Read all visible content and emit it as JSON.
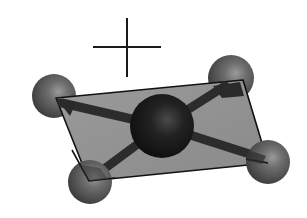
{
  "diagram": {
    "title": "Square planar molecular geometry",
    "colors": {
      "background": "#ffffff",
      "plane_fill": "#8f8f8f",
      "plane_edge": "#111111",
      "central_atom": "#1e1e1e",
      "ligand_atom": "#5a5a5a",
      "bond": "#2c2c2c",
      "axis_cross": "#1a1a1a"
    },
    "cross_axis": {
      "horizontal": {
        "x1": 93,
        "y1": 47,
        "x2": 161,
        "y2": 47
      },
      "vertical": {
        "x1": 127,
        "y1": 18,
        "x2": 127,
        "y2": 77
      }
    },
    "plane": {
      "points": "56,98 243,80 268,163 89,181"
    },
    "central_atom": {
      "label": "central atom",
      "cx": 162,
      "cy": 126,
      "r": 32
    },
    "ligands": [
      {
        "label": "ligand top-left",
        "cx": 54,
        "cy": 96,
        "r": 22
      },
      {
        "label": "ligand top-right",
        "cx": 231,
        "cy": 78,
        "r": 23
      },
      {
        "label": "ligand bottom-left",
        "cx": 90,
        "cy": 182,
        "r": 22
      },
      {
        "label": "ligand bottom-right",
        "cx": 268,
        "cy": 162,
        "r": 22
      }
    ]
  }
}
